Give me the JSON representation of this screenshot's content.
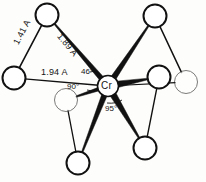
{
  "figure": {
    "kind": "molecular-structure-diagram",
    "central_atom": "Cr",
    "ink_color": "#111111",
    "atom_fill": "#ffffff",
    "background": "#fdfdfb"
  },
  "labels": {
    "center": "Cr",
    "bond_1": "1.41 A",
    "bond_2": "1.89 A",
    "bond_3": "1.94 A",
    "angle_1": "46°",
    "angle_2": "90°",
    "angle_3": "95°"
  },
  "chart_data": {
    "type": "diagram",
    "atoms": [
      {
        "id": "Cr",
        "label": "Cr",
        "x": 108,
        "y": 86,
        "r": 10.5,
        "style": "center"
      },
      {
        "id": "A1",
        "label": "",
        "x": 47,
        "y": 15,
        "r": 11.5,
        "style": "bold"
      },
      {
        "id": "A2",
        "label": "",
        "x": 155,
        "y": 16,
        "r": 11.5,
        "style": "bold"
      },
      {
        "id": "A3",
        "label": "",
        "x": 14,
        "y": 78,
        "r": 11.5,
        "style": "bold"
      },
      {
        "id": "A4",
        "label": "",
        "x": 159,
        "y": 77,
        "r": 11.5,
        "style": "bold"
      },
      {
        "id": "A5",
        "label": "",
        "x": 186,
        "y": 82,
        "r": 11.5,
        "style": "faint"
      },
      {
        "id": "A6",
        "label": "",
        "x": 66,
        "y": 100,
        "r": 11.5,
        "style": "faint"
      },
      {
        "id": "A7",
        "label": "",
        "x": 78,
        "y": 163,
        "r": 11.5,
        "style": "bold"
      },
      {
        "id": "A8",
        "label": "",
        "x": 145,
        "y": 148,
        "r": 11.5,
        "style": "bold"
      }
    ],
    "bonds": [
      {
        "from": "A1",
        "to": "Cr",
        "kind": "wedge",
        "width": 5.0,
        "label": "1.89 A"
      },
      {
        "from": "A1",
        "to": "A3",
        "kind": "line",
        "width": 1.6,
        "label": "1.41 A"
      },
      {
        "from": "A3",
        "to": "Cr",
        "kind": "line",
        "width": 1.4,
        "label": "1.94 A"
      },
      {
        "from": "A2",
        "to": "Cr",
        "kind": "wedge",
        "width": 5.5,
        "label": ""
      },
      {
        "from": "A2",
        "to": "A5",
        "kind": "line",
        "width": 1.6,
        "label": ""
      },
      {
        "from": "A4",
        "to": "Cr",
        "kind": "wedge",
        "width": 6.5,
        "label": ""
      },
      {
        "from": "A5",
        "to": "Cr",
        "kind": "line",
        "width": 1.2,
        "label": ""
      },
      {
        "from": "A6",
        "to": "Cr",
        "kind": "wedge",
        "width": 3.5,
        "label": ""
      },
      {
        "from": "A6",
        "to": "A7",
        "kind": "line",
        "width": 1.3,
        "label": ""
      },
      {
        "from": "A7",
        "to": "Cr",
        "kind": "wedge",
        "width": 5.5,
        "label": ""
      },
      {
        "from": "A8",
        "to": "Cr",
        "kind": "wedge",
        "width": 6.5,
        "label": ""
      },
      {
        "from": "A8",
        "to": "A4",
        "kind": "line",
        "width": 1.4,
        "label": ""
      }
    ],
    "annotations": [
      {
        "text": "1.41 A",
        "x": 22,
        "y": 48,
        "rot": -62,
        "role": "bond-length"
      },
      {
        "text": "1.89 A",
        "x": 74,
        "y": 42,
        "rot": 50,
        "role": "bond-length"
      },
      {
        "text": "1.94 A",
        "x": 57,
        "y": 73,
        "rot": 0,
        "role": "bond-length"
      },
      {
        "text": "46°",
        "x": 88,
        "y": 73,
        "rot": 0,
        "role": "bond-angle"
      },
      {
        "text": "90°",
        "x": 76,
        "y": 89,
        "rot": 0,
        "role": "bond-angle"
      },
      {
        "text": "95°",
        "x": 112,
        "y": 112,
        "rot": 0,
        "role": "bond-angle"
      }
    ]
  }
}
